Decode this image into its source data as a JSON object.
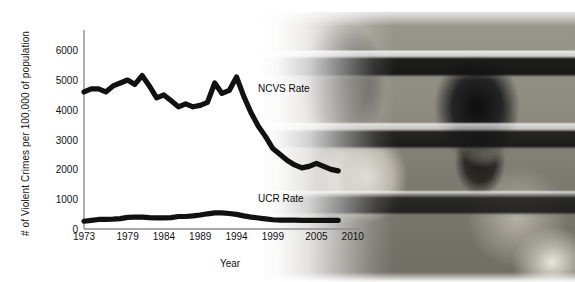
{
  "chart_data": {
    "type": "line",
    "title": "",
    "xlabel": "Year",
    "ylabel": "# of Violent Crimes per 100,000 of population",
    "xlim": [
      1973,
      2011
    ],
    "ylim": [
      0,
      6600
    ],
    "ytick_labels": [
      "0",
      "1000",
      "2000",
      "3000",
      "4000",
      "5000",
      "6000"
    ],
    "ytick_values": [
      0,
      1000,
      2000,
      3000,
      4000,
      5000,
      6000
    ],
    "xtick_labels": [
      "1973",
      "1979",
      "1984",
      "1989",
      "1994",
      "1999",
      "2005",
      "2010"
    ],
    "xtick_values": [
      1973,
      1979,
      1984,
      1989,
      1994,
      1999,
      2005,
      2010
    ],
    "grid": false,
    "legend_position": "inline-right",
    "series": [
      {
        "name": "NCVS Rate",
        "color": "#111111",
        "x": [
          1973,
          1974,
          1975,
          1976,
          1977,
          1978,
          1979,
          1980,
          1981,
          1982,
          1983,
          1984,
          1985,
          1986,
          1987,
          1988,
          1989,
          1990,
          1991,
          1992,
          1993,
          1994,
          1995,
          1996,
          1997,
          1998,
          1999,
          2000,
          2001,
          2002,
          2003,
          2004,
          2005,
          2006,
          2007,
          2008
        ],
        "y": [
          4600,
          4700,
          4700,
          4600,
          4800,
          4900,
          5000,
          4850,
          5150,
          4800,
          4400,
          4500,
          4300,
          4100,
          4200,
          4100,
          4150,
          4250,
          4900,
          4550,
          4650,
          5100,
          4450,
          3900,
          3450,
          3100,
          2700,
          2500,
          2300,
          2150,
          2050,
          2100,
          2200,
          2100,
          2000,
          1950
        ]
      },
      {
        "name": "UCR Rate",
        "color": "#111111",
        "x": [
          1973,
          1974,
          1975,
          1976,
          1977,
          1978,
          1979,
          1980,
          1981,
          1982,
          1983,
          1984,
          1985,
          1986,
          1987,
          1988,
          1989,
          1990,
          1991,
          1992,
          1993,
          1994,
          1995,
          1996,
          1997,
          1998,
          1999,
          2000,
          2001,
          2002,
          2003,
          2004,
          2005,
          2006,
          2007,
          2008
        ],
        "y": [
          260,
          290,
          320,
          320,
          330,
          350,
          390,
          400,
          400,
          380,
          370,
          370,
          380,
          420,
          420,
          440,
          470,
          510,
          540,
          540,
          520,
          490,
          440,
          400,
          370,
          340,
          310,
          300,
          300,
          300,
          290,
          290,
          290,
          290,
          290,
          290
        ]
      }
    ]
  },
  "annotations": {
    "ncvs_label": "NCVS Rate",
    "ucr_label": "UCR Rate"
  },
  "photo": {
    "description": "people-behind-blinds-photograph"
  }
}
